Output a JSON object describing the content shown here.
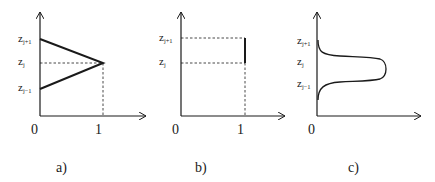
{
  "figure": {
    "panels": [
      {
        "id": "a",
        "caption": "a)",
        "x_ticks": [
          "0",
          "1"
        ],
        "y_labels": [
          {
            "base": "z",
            "sub": "j+1"
          },
          {
            "base": "z",
            "sub": "j"
          },
          {
            "base": "z",
            "sub": "j−1"
          }
        ],
        "shape": "triangular hat function peaking at 1 at z_j, zero at z_{j-1} and z_{j+1}"
      },
      {
        "id": "b",
        "caption": "b)",
        "x_ticks": [
          "0",
          "1"
        ],
        "y_labels": [
          {
            "base": "z",
            "sub": "j+1"
          },
          {
            "base": "z",
            "sub": "j"
          }
        ],
        "shape": "box function equal to 1 between z_j and z_{j+1}"
      },
      {
        "id": "c",
        "caption": "c)",
        "x_ticks": [
          "0"
        ],
        "y_labels": [
          {
            "base": "z",
            "sub": "j+1"
          },
          {
            "base": "z",
            "sub": "j"
          },
          {
            "base": "z",
            "sub": "j−1"
          }
        ],
        "shape": "smooth bell-shaped curve peaking at z_j"
      }
    ],
    "colors": {
      "line": "#1a1a1a",
      "background": "#ffffff"
    }
  }
}
